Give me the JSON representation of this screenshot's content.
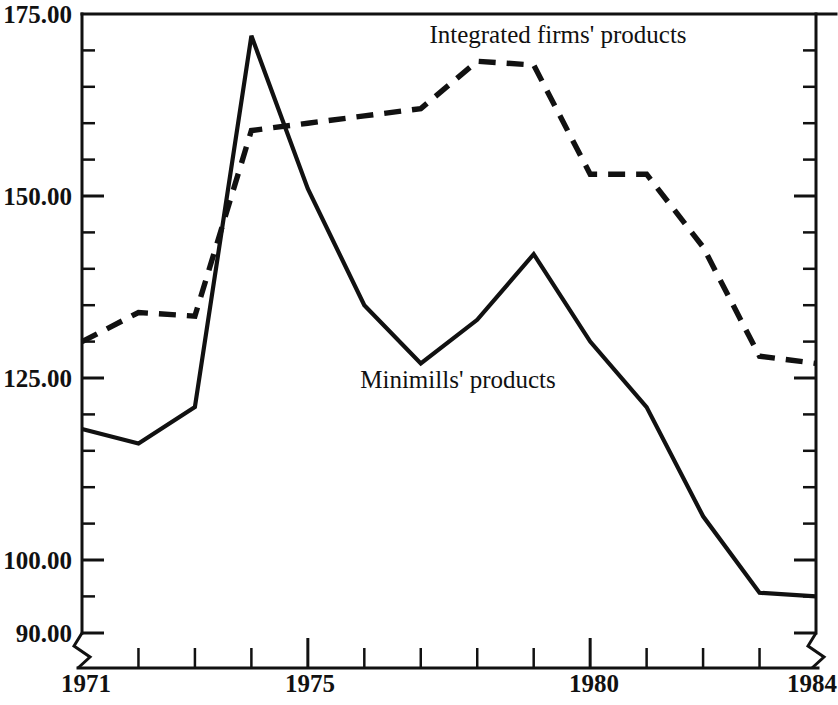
{
  "chart_data": {
    "type": "line",
    "title": "",
    "subtitle": "",
    "xlabel": "",
    "ylabel": "",
    "x": [
      1971,
      1972,
      1973,
      1974,
      1975,
      1976,
      1977,
      1978,
      1979,
      1980,
      1981,
      1982,
      1983,
      1984
    ],
    "xlim": [
      1971,
      1984
    ],
    "ylim": [
      90,
      175
    ],
    "y_axis_break": {
      "present": true,
      "between": [
        90,
        100
      ]
    },
    "x_axis_break": {
      "present": true,
      "note": "zigzag break marks at both ends of x axis near origin and right edge"
    },
    "grid": false,
    "legend_position": "inline-annotations",
    "y_ticks_major": [
      "175.00",
      "150.00",
      "125.00",
      "100.00",
      "90.00"
    ],
    "y_ticks_major_values": [
      175,
      150,
      125,
      100,
      90
    ],
    "y_minor_tick_step": 5,
    "x_ticks_labeled": [
      "1971",
      "1975",
      "1980",
      "1984"
    ],
    "x_ticks_labeled_values": [
      1971,
      1975,
      1980,
      1984
    ],
    "series": [
      {
        "name": "Integrated firms' products",
        "style": "dashed",
        "color": "#111111",
        "values": [
          130.0,
          134.0,
          133.5,
          159.0,
          160.0,
          161.0,
          162.0,
          168.5,
          168.0,
          153.0,
          153.0,
          143.0,
          128.0,
          127.0
        ]
      },
      {
        "name": "Minimills' products",
        "style": "solid",
        "color": "#111111",
        "values": [
          118.0,
          116.0,
          121.0,
          172.0,
          151.0,
          135.0,
          127.0,
          133.0,
          142.0,
          130.0,
          121.0,
          106.0,
          95.5,
          95.0
        ]
      }
    ],
    "annotations": [
      {
        "text": "Integrated firms' products",
        "x": 1978.3,
        "y": 174.0,
        "series": "Integrated firms' products"
      },
      {
        "text": "Minimills' products",
        "x": 1977.0,
        "y": 124.0,
        "series": "Minimills' products"
      }
    ]
  },
  "axis": {
    "y_labels": [
      {
        "text": "175.00",
        "value": 175
      },
      {
        "text": "150.00",
        "value": 150
      },
      {
        "text": "125.00",
        "value": 125
      },
      {
        "text": "100.00",
        "value": 100
      },
      {
        "text": "90.00",
        "value": 90
      }
    ],
    "x_labels": [
      {
        "text": "1971",
        "value": 1971
      },
      {
        "text": "1975",
        "value": 1975
      },
      {
        "text": "1980",
        "value": 1980
      },
      {
        "text": "1984",
        "value": 1984
      }
    ]
  },
  "labels": {
    "integrated": "Integrated firms' products",
    "minimills": "Minimills' products"
  },
  "colors": {
    "ink": "#111111",
    "background": "#ffffff"
  }
}
